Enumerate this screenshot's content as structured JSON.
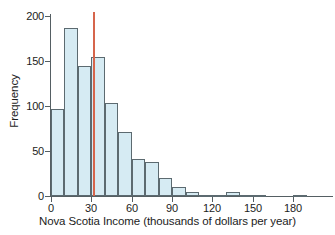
{
  "chart_data": {
    "type": "bar",
    "title": "",
    "subtitle": "",
    "xlabel": "Nova Scotia Income (thousands of dollars per year)",
    "ylabel": "Frequency",
    "xlim": [
      -5,
      205
    ],
    "ylim": [
      0,
      205
    ],
    "xticks": [
      0,
      30,
      60,
      90,
      120,
      150,
      180
    ],
    "xtick_labels": [
      "0",
      "30",
      "60",
      "90",
      "120",
      "150",
      "180"
    ],
    "yticks": [
      0,
      50,
      100,
      150,
      200
    ],
    "ytick_labels": [
      "0",
      "50",
      "100",
      "150",
      "200"
    ],
    "grid": false,
    "legend": "none",
    "bin_width": 10,
    "bin_starts": [
      0,
      10,
      20,
      30,
      40,
      50,
      60,
      70,
      80,
      90,
      100,
      110,
      120,
      130,
      140,
      150,
      160,
      170,
      180,
      190
    ],
    "categories": [
      "0-10",
      "10-20",
      "20-30",
      "30-40",
      "40-50",
      "50-60",
      "60-70",
      "70-80",
      "80-90",
      "90-100",
      "100-110",
      "110-120",
      "120-130",
      "130-140",
      "140-150",
      "150-160",
      "160-170",
      "170-180",
      "180-190",
      "190-200"
    ],
    "values": [
      97,
      187,
      145,
      154,
      103,
      71,
      41,
      38,
      20,
      10,
      4,
      1,
      1,
      4,
      1,
      1,
      0,
      0,
      1,
      0
    ],
    "bar_fill_color": "#d6ebf3",
    "bar_edge_color": "#5c6a70",
    "annotations": [
      {
        "name": "median-line",
        "type": "vline",
        "x": 31,
        "y_top": 204,
        "y_bottom": 0,
        "color": "#d6654c",
        "label": ""
      }
    ]
  }
}
